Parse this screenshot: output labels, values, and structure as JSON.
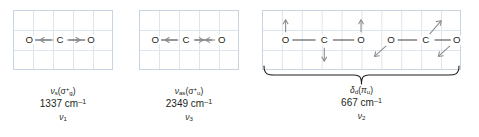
{
  "figure": {
    "molecule": "CO2",
    "atom_labels": {
      "oxygen": "O",
      "carbon": "C"
    },
    "grid_color": "#dde5ee",
    "border_color": "#c8d4e0",
    "bond_color": "#58595b",
    "arrow_color": "#8a8c8e",
    "text_color": "#231f20"
  },
  "modes": [
    {
      "id": "symmetric-stretch",
      "mode_symbol": "ν",
      "mode_subscript": "s",
      "symmetry_open": "(",
      "symmetry_symbol": "σ",
      "symmetry_superscript": "+",
      "symmetry_subscript": "g",
      "symmetry_close": ")",
      "mode_label_plain": "νs(σ+g)",
      "wavenumber": "1337",
      "unit": "cm",
      "unit_exponent": "–1",
      "frequency_plain": "1337 cm⁻¹",
      "number_symbol": "ν",
      "number_subscript": "1",
      "number_plain": "ν1",
      "atoms": [
        "O",
        "C",
        "O"
      ],
      "arrows": [
        "left",
        "right"
      ],
      "description": "Symmetric stretch: both oxygen atoms move outward from carbon"
    },
    {
      "id": "asymmetric-stretch",
      "mode_symbol": "ν",
      "mode_subscript": "as",
      "symmetry_open": "(",
      "symmetry_symbol": "σ",
      "symmetry_superscript": "+",
      "symmetry_subscript": "u",
      "symmetry_close": ")",
      "mode_label_plain": "νas(σ+u)",
      "wavenumber": "2349",
      "unit": "cm",
      "unit_exponent": "–1",
      "frequency_plain": "2349 cm⁻¹",
      "number_symbol": "ν",
      "number_subscript": "3",
      "number_plain": "ν3",
      "atoms": [
        "O",
        "C",
        "O"
      ],
      "arrows": [
        "left",
        "right",
        "left"
      ],
      "description": "Asymmetric stretch: whole molecule translates, arrows converge at right oxygen"
    },
    {
      "id": "bending",
      "mode_symbol": "δ",
      "mode_subscript": "d",
      "symmetry_open": "(",
      "symmetry_symbol": "π",
      "symmetry_superscript": "",
      "symmetry_subscript": "u",
      "symmetry_close": ")",
      "mode_label_plain": "δd(πu)",
      "wavenumber": "667",
      "unit": "cm",
      "unit_exponent": "–1",
      "frequency_plain": "667 cm⁻¹",
      "number_symbol": "ν",
      "number_subscript": "2",
      "number_plain": "ν2",
      "atoms": [
        "O",
        "C",
        "O"
      ],
      "arrows": [
        "up",
        "down",
        "up",
        "down-left",
        "up-right",
        "down-left"
      ],
      "description": "Doubly degenerate bend: in-plane bend (left) and the orthogonal degenerate component (right), joined by a brace"
    }
  ]
}
